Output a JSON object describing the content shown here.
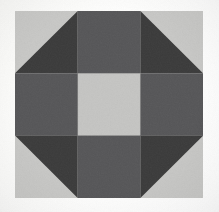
{
  "image": {
    "title": "Patchwork quilt block",
    "subject": "geometric quilt square",
    "width": 219,
    "height": 212,
    "background_color": "#fdfdfc"
  },
  "block": {
    "name": "octagon quilt block",
    "x": 15,
    "y": 11,
    "width": 188,
    "height": 187,
    "grid_rows": 3,
    "grid_cols": 3,
    "cell_width": 62.7,
    "cell_height": 62.3
  },
  "palette": {
    "light": "#c9c9c7",
    "light_alt": "#c6c6c4",
    "medium": "#565658",
    "medium_alt": "#5a5a5c",
    "dark": "#3a3a3a",
    "dark_alt": "#363638",
    "background": "#fdfdfc",
    "seam": "#9a9a98"
  },
  "cells": [
    {
      "name": "top-left-corner",
      "row": 0,
      "col": 0,
      "type": "half-square-triangle",
      "base_color": "#c9c9c7",
      "triangle_color": "#3a3a3a",
      "triangle_points": "62.7,0 62.7,62.3 0,62.3",
      "triangle_corner": "bottom-right"
    },
    {
      "name": "top-center-edge",
      "row": 0,
      "col": 1,
      "type": "solid",
      "base_color": "#565658",
      "triangle_color": null,
      "triangle_points": null,
      "triangle_corner": null
    },
    {
      "name": "top-right-corner",
      "row": 0,
      "col": 2,
      "type": "half-square-triangle",
      "base_color": "#c9c9c7",
      "triangle_color": "#3a3a3a",
      "triangle_points": "0,0 62.7,62.3 0,62.3",
      "triangle_corner": "bottom-left"
    },
    {
      "name": "middle-left-edge",
      "row": 1,
      "col": 0,
      "type": "solid",
      "base_color": "#565658",
      "triangle_color": null,
      "triangle_points": null,
      "triangle_corner": null
    },
    {
      "name": "center-square",
      "row": 1,
      "col": 1,
      "type": "solid",
      "base_color": "#c6c6c4",
      "triangle_color": null,
      "triangle_points": null,
      "triangle_corner": null
    },
    {
      "name": "middle-right-edge",
      "row": 1,
      "col": 2,
      "type": "solid",
      "base_color": "#565658",
      "triangle_color": null,
      "triangle_points": null,
      "triangle_corner": null
    },
    {
      "name": "bottom-left-corner",
      "row": 2,
      "col": 0,
      "type": "half-square-triangle",
      "base_color": "#c9c9c7",
      "triangle_color": "#3a3a3a",
      "triangle_points": "0,0 62.7,0 62.7,62.3",
      "triangle_corner": "top-right"
    },
    {
      "name": "bottom-center-edge",
      "row": 2,
      "col": 1,
      "type": "solid",
      "base_color": "#565658",
      "triangle_color": null,
      "triangle_points": null,
      "triangle_corner": null
    },
    {
      "name": "bottom-right-corner",
      "row": 2,
      "col": 2,
      "type": "half-square-triangle",
      "base_color": "#c9c9c7",
      "triangle_color": "#3a3a3a",
      "triangle_points": "0,0 62.7,0 0,62.3",
      "triangle_corner": "top-left"
    }
  ]
}
